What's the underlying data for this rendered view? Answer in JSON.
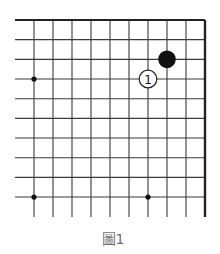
{
  "diagram": {
    "type": "go-board-fragment",
    "caption": "圖1",
    "board": {
      "corner": "top-right",
      "columns_visible": 10,
      "rows_visible": 10,
      "line_color": "#3a3a3a",
      "edge_color": "#222222"
    },
    "star_points": [
      {
        "col": 0,
        "row": 3
      },
      {
        "col": 0,
        "row": 9
      },
      {
        "col": 6,
        "row": 9
      }
    ],
    "stones": [
      {
        "color": "black",
        "col": 7,
        "row": 2,
        "label": ""
      },
      {
        "color": "white",
        "col": 6,
        "row": 3,
        "label": "1"
      }
    ]
  }
}
